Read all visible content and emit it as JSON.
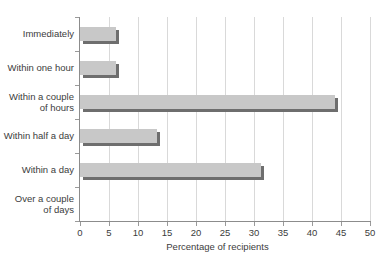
{
  "chart_data": {
    "type": "bar",
    "orientation": "horizontal",
    "title": "",
    "xlabel": "Percentage of recipients",
    "ylabel": "",
    "xlim": [
      0,
      50
    ],
    "xticks": [
      0,
      5,
      10,
      15,
      20,
      25,
      30,
      35,
      40,
      45,
      50
    ],
    "grid": "vertical",
    "legend": "none",
    "categories": [
      "Immediately",
      "Within one hour",
      "Within a couple\nof hours",
      "Within half a day",
      "Within a day",
      "Over a couple\nof days"
    ],
    "values": [
      6.2,
      6.2,
      44.0,
      13.3,
      31.2,
      0
    ],
    "colors": {
      "bar_fill": "#c8c8c8",
      "bar_shadow": "#6e6e6e",
      "gridline": "#d9d9d9",
      "axis": "#8c8c8c",
      "text": "#3c3c3c",
      "background": "#ffffff"
    }
  }
}
